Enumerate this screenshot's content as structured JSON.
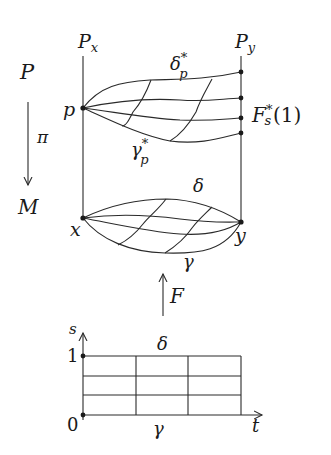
{
  "diagram": {
    "fiber_labels": {
      "left": "P",
      "left_sub": "x",
      "right": "P",
      "right_sub": "y"
    },
    "bundle_label": "P",
    "base_label": "M",
    "projection_label": "π",
    "lift_point": "p",
    "upper_top_curve": {
      "base": "δ",
      "sup": "*",
      "sub": "p"
    },
    "upper_bottom_curve": {
      "base": "γ",
      "sup": "*",
      "sub": "p"
    },
    "endpoint_family": {
      "base": "F",
      "sup": "*",
      "sub": "s",
      "arg": "(1)"
    },
    "lower_top_curve": "δ",
    "lower_bottom_curve": "γ",
    "base_start": "x",
    "base_end": "y",
    "homotopy_map": "F",
    "square": {
      "s_axis": "s",
      "t_axis": "t",
      "s_one": "1",
      "s_zero": "0",
      "top_label": "δ",
      "bottom_label": "γ",
      "grid_columns": 3,
      "grid_rows": 3
    }
  }
}
